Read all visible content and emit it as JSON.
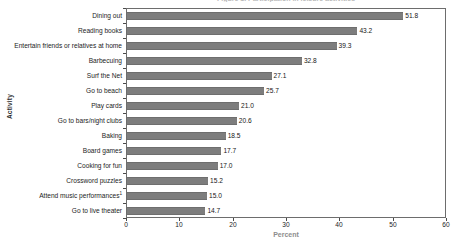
{
  "chart_data": {
    "type": "bar",
    "orientation": "horizontal",
    "title": "Figure 1. Participation in leisure activities",
    "xlabel": "Percent",
    "ylabel": "Activity",
    "xlim": [
      0,
      60
    ],
    "xticks": [
      "0",
      "10",
      "20",
      "30",
      "40",
      "50",
      "60"
    ],
    "grid": false,
    "legend": "none",
    "categories": [
      "Dining out",
      "Reading books",
      "Entertain friends or relatives at home",
      "Barbecuing",
      "Surf the Net",
      "Go to beach",
      "Play cards",
      "Go to bars/night clubs",
      "Baking",
      "Board games",
      "Cooking for fun",
      "Crossword puzzles",
      "Attend music performances",
      "Go to live theater"
    ],
    "category_footnotes": {
      "Attend music performances": "1"
    },
    "values": [
      51.8,
      43.2,
      39.3,
      32.8,
      27.1,
      25.7,
      21.0,
      20.6,
      18.5,
      17.7,
      17.0,
      15.2,
      15.0,
      14.7
    ],
    "value_labels": [
      "51.8",
      "43.2",
      "39.3",
      "32.8",
      "27.1",
      "25.7",
      "21.0",
      "20.6",
      "18.5",
      "17.7",
      "17.0",
      "15.2",
      "15.0",
      "14.7"
    ],
    "bar_color": "#7d7d7d",
    "frame_color": "#6d6d6d",
    "text_color": "#1c1c1c"
  }
}
